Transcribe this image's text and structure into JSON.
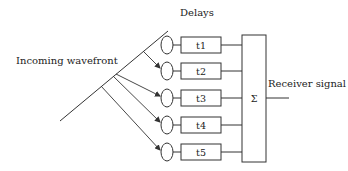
{
  "diagram": {
    "title_delays": "Delays",
    "wavefront_label": "Incoming wavefront",
    "output_label": "Receiver signal",
    "sum_symbol": "Σ",
    "delays": [
      {
        "label": "t1"
      },
      {
        "label": "t2"
      },
      {
        "label": "t3"
      },
      {
        "label": "t4"
      },
      {
        "label": "t5"
      }
    ],
    "colors": {
      "stroke": "#333333",
      "text": "#222222",
      "background": "#ffffff"
    }
  }
}
